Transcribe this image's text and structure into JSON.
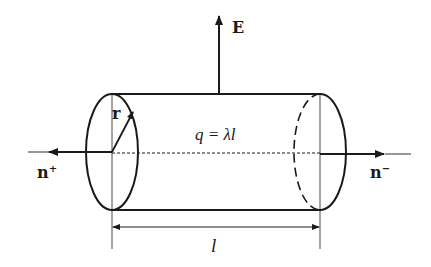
{
  "diagram": {
    "type": "gaussian-cylinder",
    "labels": {
      "field": "E",
      "radius": "r",
      "charge": "q = λl",
      "normal_left": "n",
      "normal_left_sup": "+",
      "normal_right": "n",
      "normal_right_sup": "−",
      "length": "l"
    },
    "colors": {
      "stroke": "#1a1a1a",
      "background": "#ffffff"
    }
  }
}
